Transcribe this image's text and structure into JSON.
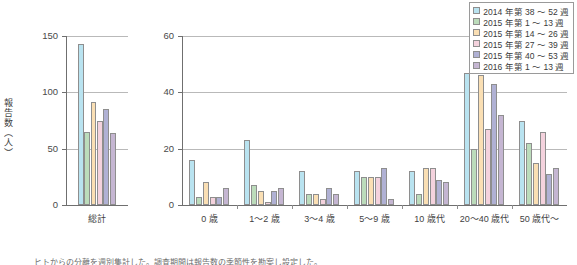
{
  "figure": {
    "ylabel": "報告数（人）",
    "caption": "ヒトからの分離を週別集計した。調査期間は報告数の季節性を勘案し設定した。"
  },
  "legend": {
    "position": "top-right",
    "items": [
      {
        "label": "2014 年第 38 ～ 52 週",
        "color": "#b9e3f0"
      },
      {
        "label": "2015 年第 1 ～ 13 週",
        "color": "#bcdcbb"
      },
      {
        "label": "2015 年第 14 ～ 26 週",
        "color": "#fadfb4"
      },
      {
        "label": "2015 年第 27 ～ 39 週",
        "color": "#f4d2dd"
      },
      {
        "label": "2015 年第 40 ～ 53 週",
        "color": "#b0b1d4"
      },
      {
        "label": "2016 年第 1 ～ 13 週",
        "color": "#c5b6d2"
      }
    ]
  },
  "chart_data": [
    {
      "type": "bar",
      "title": "",
      "xlabel": "",
      "ylabel": "報告数（人）",
      "categories": [
        "総計"
      ],
      "ylim": [
        0,
        150
      ],
      "yticks": [
        0,
        50,
        100,
        150
      ],
      "grid": true,
      "series": [
        {
          "name": "2014 年第 38 ～ 52 週",
          "color": "#b9e3f0",
          "values": [
            143
          ]
        },
        {
          "name": "2015 年第 1 ～ 13 週",
          "color": "#bcdcbb",
          "values": [
            65
          ]
        },
        {
          "name": "2015 年第 14 ～ 26 週",
          "color": "#fadfb4",
          "values": [
            91
          ]
        },
        {
          "name": "2015 年第 27 ～ 39 週",
          "color": "#f4d2dd",
          "values": [
            75
          ]
        },
        {
          "name": "2015 年第 40 ～ 53 週",
          "color": "#b0b1d4",
          "values": [
            85
          ]
        },
        {
          "name": "2016 年第 1 ～ 13 週",
          "color": "#c5b6d2",
          "values": [
            64
          ]
        }
      ]
    },
    {
      "type": "bar",
      "title": "",
      "xlabel": "",
      "ylabel": "",
      "categories": [
        "0 歳",
        "1～2 歳",
        "3～4 歳",
        "5～9 歳",
        "10 歳代",
        "20～40 歳代",
        "50 歳代～"
      ],
      "ylim": [
        0,
        60
      ],
      "yticks": [
        0,
        20,
        40,
        60
      ],
      "grid": true,
      "series": [
        {
          "name": "2014 年第 38 ～ 52 週",
          "color": "#b9e3f0",
          "values": [
            16,
            23,
            12,
            12,
            12,
            47,
            30
          ]
        },
        {
          "name": "2015 年第 1 ～ 13 週",
          "color": "#bcdcbb",
          "values": [
            3,
            7,
            4,
            10,
            4,
            20,
            22
          ]
        },
        {
          "name": "2015 年第 14 ～ 26 週",
          "color": "#fadfb4",
          "values": [
            8,
            5,
            4,
            10,
            13,
            46,
            15
          ]
        },
        {
          "name": "2015 年第 27 ～ 39 週",
          "color": "#f4d2dd",
          "values": [
            3,
            1,
            2,
            10,
            13,
            27,
            26
          ]
        },
        {
          "name": "2015 年第 40 ～ 53 週",
          "color": "#b0b1d4",
          "values": [
            3,
            5,
            6,
            13,
            9,
            43,
            11
          ]
        },
        {
          "name": "2016 年第 1 ～ 13 週",
          "color": "#c5b6d2",
          "values": [
            6,
            6,
            4,
            2,
            8,
            32,
            13
          ]
        }
      ]
    }
  ]
}
